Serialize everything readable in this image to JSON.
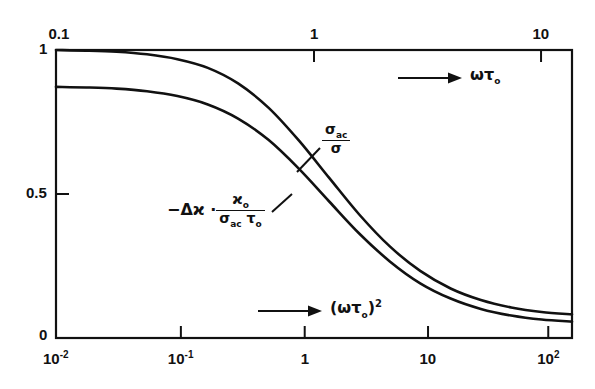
{
  "figure": {
    "background": "#ffffff",
    "line_color": "#111111",
    "frame_color": "#111111"
  },
  "axes": {
    "top": {
      "variable": "omega*tau_0",
      "label_text": "ωτ",
      "label_sub": "o",
      "arrow": "→",
      "ticks": [
        {
          "label": "0.1",
          "value": 0.1,
          "x_frac": 0.0
        },
        {
          "label": "1",
          "value": 1,
          "x_frac": 0.5
        },
        {
          "label": "10",
          "value": 10,
          "x_frac": 0.94
        }
      ]
    },
    "bottom": {
      "variable": "(omega*tau_0)^2",
      "label_base": "(ωτ",
      "label_sub": "o",
      "label_close": ")",
      "label_sup": "2",
      "arrow": "→",
      "ticks": [
        {
          "label_base": "10",
          "label_sup": "-2",
          "value": 0.01,
          "x_frac": 0.0
        },
        {
          "label_base": "10",
          "label_sup": "-1",
          "value": 0.1,
          "x_frac": 0.242
        },
        {
          "label_base": "1",
          "label_sup": "",
          "value": 1,
          "x_frac": 0.482
        },
        {
          "label_base": "10",
          "label_sup": "",
          "value": 10,
          "x_frac": 0.721
        },
        {
          "label_base": "10",
          "label_sup": "2",
          "value": 100,
          "x_frac": 0.954
        }
      ]
    },
    "left": {
      "ticks": [
        {
          "label": "1",
          "value": 1.0
        },
        {
          "label": "0.5",
          "value": 0.5
        },
        {
          "label": "0",
          "value": 0.0
        }
      ],
      "ylim": [
        0,
        1
      ]
    }
  },
  "annotations": {
    "curve_upper": {
      "numerator": "σ",
      "numerator_sub": "ac",
      "denominator": "σ",
      "leader": true
    },
    "curve_lower": {
      "prefix": "−Δϰ ·",
      "numerator": "ϰ",
      "numerator_sub": "o",
      "denominator_a": "σ",
      "denominator_a_sub": "ac",
      "denominator_b": "τ",
      "denominator_b_sub": "o",
      "leader": true
    }
  },
  "chart_data": {
    "type": "line",
    "title": "",
    "xlabel": "(ωτo)²",
    "ylabel": "",
    "xscale": "log",
    "xlim": [
      0.01,
      178
    ],
    "ylim": [
      0,
      1
    ],
    "grid": false,
    "legend": "inline-annotations",
    "x": [
      0.01,
      0.0178,
      0.0316,
      0.0562,
      0.1,
      0.178,
      0.316,
      0.562,
      1.0,
      1.78,
      3.16,
      5.62,
      10.0,
      17.8,
      31.6,
      56.2,
      100.0,
      178.0
    ],
    "series": [
      {
        "name": "σac/σ",
        "label": "σac / σ",
        "values": [
          1.0,
          0.998,
          0.994,
          0.985,
          0.968,
          0.938,
          0.884,
          0.8,
          0.686,
          0.556,
          0.428,
          0.318,
          0.233,
          0.172,
          0.132,
          0.106,
          0.09,
          0.082
        ]
      },
      {
        "name": "-dkappa",
        "label": "−Δϰ · ϰo /(σac τo)",
        "values": [
          0.872,
          0.87,
          0.866,
          0.857,
          0.84,
          0.811,
          0.762,
          0.688,
          0.588,
          0.474,
          0.362,
          0.266,
          0.19,
          0.137,
          0.101,
          0.078,
          0.064,
          0.057
        ]
      }
    ]
  }
}
